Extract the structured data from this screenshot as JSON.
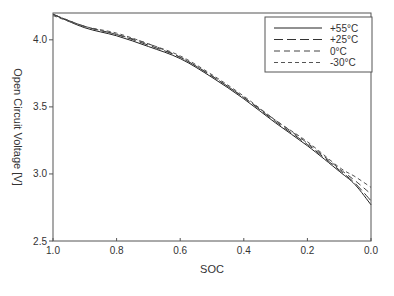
{
  "chart_data": {
    "type": "line",
    "title": "",
    "xlabel": "SOC",
    "ylabel": "Open Circuit Voltage [V]",
    "xlim": [
      1.0,
      0.0
    ],
    "ylim": [
      2.5,
      4.2
    ],
    "x_reversed": true,
    "grid": false,
    "legend_position": "top-right",
    "x_ticks": [
      "1.0",
      "0.8",
      "0.6",
      "0.4",
      "0.2",
      "0.0"
    ],
    "y_ticks": [
      "2.5",
      "3.0",
      "3.5",
      "4.0"
    ],
    "x": [
      1.0,
      0.9,
      0.8,
      0.7,
      0.6,
      0.5,
      0.4,
      0.3,
      0.2,
      0.1,
      0.05,
      0.0
    ],
    "series": [
      {
        "name": "+55°C",
        "style": "solid",
        "values": [
          4.19,
          4.09,
          4.03,
          3.95,
          3.86,
          3.72,
          3.56,
          3.38,
          3.21,
          3.02,
          2.92,
          2.77
        ]
      },
      {
        "name": "+25°C",
        "style": "long-dash",
        "values": [
          4.19,
          4.1,
          4.04,
          3.96,
          3.87,
          3.73,
          3.57,
          3.39,
          3.22,
          3.03,
          2.93,
          2.8
        ]
      },
      {
        "name": "0°C",
        "style": "dash",
        "values": [
          4.19,
          4.1,
          4.04,
          3.97,
          3.87,
          3.73,
          3.57,
          3.4,
          3.23,
          3.04,
          2.95,
          2.85
        ]
      },
      {
        "name": "-30°C",
        "style": "short-dash",
        "values": [
          4.18,
          4.1,
          4.05,
          3.97,
          3.88,
          3.74,
          3.58,
          3.4,
          3.24,
          3.05,
          2.98,
          2.9
        ]
      }
    ]
  },
  "labels": {
    "x_axis_title": "SOC",
    "y_axis_title": "Open Circuit Voltage [V]",
    "legend": [
      "+55°C",
      "+25°C",
      "0°C",
      "-30°C"
    ]
  }
}
